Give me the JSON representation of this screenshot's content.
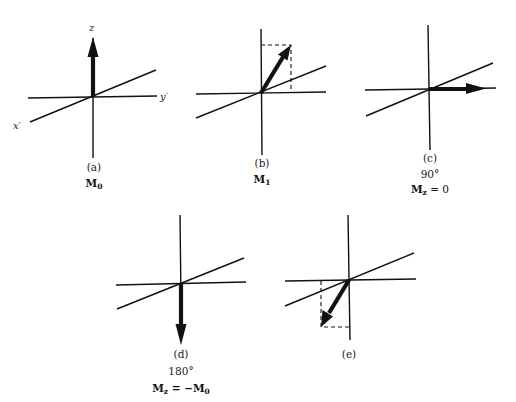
{
  "figure": {
    "colors": {
      "ink": "#111111",
      "background": "#ffffff"
    },
    "axis_labels": {
      "z": "z",
      "x": "x′",
      "y": "y′"
    },
    "panels": [
      {
        "id": "a",
        "label": "(a)",
        "angle": "",
        "vector_main": "M",
        "vector_sub": "0",
        "equation_rhs": "",
        "vector_direction": "up (+z)"
      },
      {
        "id": "b",
        "label": "(b)",
        "angle": "",
        "vector_main": "M",
        "vector_sub": "1",
        "equation_rhs": "",
        "vector_direction": "tilted between +z and +y'"
      },
      {
        "id": "c",
        "label": "(c)",
        "angle": "90°",
        "vector_main": "M",
        "vector_sub": "z",
        "equation_rhs": " = 0",
        "vector_direction": "along +y'"
      },
      {
        "id": "d",
        "label": "(d)",
        "angle": "180°",
        "vector_main": "M",
        "vector_sub": "z",
        "equation_rhs_prefix": " = −M",
        "equation_rhs_sub": "0",
        "vector_direction": "down (−z)"
      },
      {
        "id": "e",
        "label": "(e)",
        "angle": "",
        "vector_main": "",
        "vector_sub": "",
        "equation_rhs": "",
        "vector_direction": "tilted between −z and −y'"
      }
    ]
  }
}
